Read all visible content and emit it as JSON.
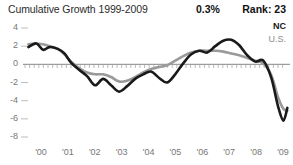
{
  "header": {
    "title": "Cumulative Growth 1999-2009",
    "stat_value": "0.3%",
    "rank": "Rank: 23"
  },
  "legend": {
    "series_primary": "NC",
    "series_secondary": "U.S.",
    "color_primary": "#1a1a1a",
    "color_secondary": "#9a9a9a"
  },
  "axes": {
    "y_ticks": [
      "4",
      "2",
      "0",
      "-2",
      "-4",
      "-6",
      "-8"
    ],
    "x_ticks": [
      "'00",
      "'01",
      "'02",
      "'03",
      "'04",
      "'05",
      "'06",
      "'07",
      "'08",
      "'09"
    ]
  },
  "chart_data": {
    "type": "line",
    "title": "Cumulative Growth 1999-2009",
    "subtitle": "",
    "xlabel": "",
    "ylabel": "",
    "ylim": [
      -8,
      4
    ],
    "xlim": [
      1999.75,
      2009.6
    ],
    "grid": false,
    "zero_line": true,
    "legend_position": "top-right",
    "annotations": [
      {
        "label": "0.3%",
        "role": "current-value"
      },
      {
        "label": "Rank: 23",
        "role": "state-rank"
      }
    ],
    "x": [
      1999.8,
      2000.1,
      2000.35,
      2000.6,
      2000.9,
      2001.15,
      2001.4,
      2001.7,
      2002.0,
      2002.3,
      2002.6,
      2002.9,
      2003.2,
      2003.5,
      2003.8,
      2004.1,
      2004.4,
      2004.7,
      2005.0,
      2005.3,
      2005.6,
      2005.9,
      2006.2,
      2006.5,
      2006.8,
      2007.1,
      2007.4,
      2007.7,
      2008.0,
      2008.3,
      2008.6,
      2008.9,
      2009.15,
      2009.35,
      2009.5
    ],
    "series": [
      {
        "name": "NC",
        "color": "#1a1a1a",
        "values": [
          1.9,
          2.3,
          1.6,
          1.9,
          1.7,
          1.2,
          0.2,
          -0.6,
          -1.3,
          -2.3,
          -1.6,
          -2.3,
          -3.0,
          -2.4,
          -1.6,
          -1.1,
          -0.8,
          -1.5,
          -2.0,
          -1.1,
          0.1,
          1.1,
          1.5,
          1.3,
          2.0,
          2.6,
          2.7,
          2.1,
          1.0,
          0.3,
          0.4,
          -1.5,
          -4.6,
          -6.2,
          -4.8
        ]
      },
      {
        "name": "U.S.",
        "color": "#9a9a9a",
        "values": [
          2.2,
          2.3,
          2.2,
          2.0,
          1.7,
          1.1,
          0.3,
          -0.4,
          -0.9,
          -1.1,
          -1.1,
          -1.4,
          -1.9,
          -1.8,
          -1.4,
          -0.9,
          -0.5,
          -0.3,
          -0.1,
          0.4,
          0.9,
          1.3,
          1.5,
          1.5,
          1.5,
          1.4,
          1.2,
          1.0,
          0.7,
          0.4,
          0.1,
          -1.2,
          -3.6,
          -4.9,
          -5.1
        ]
      }
    ]
  }
}
